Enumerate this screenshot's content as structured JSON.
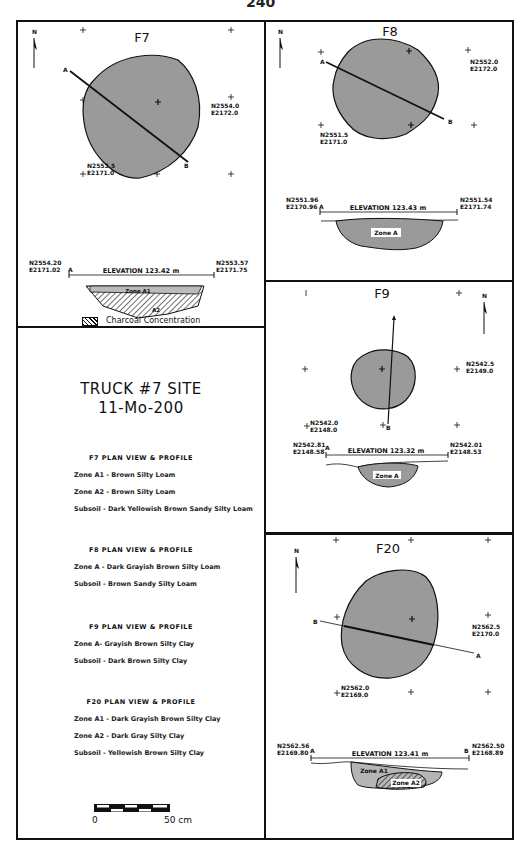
{
  "page_number": "240",
  "panels": {
    "f7": {
      "title": "F7",
      "north": "N",
      "datum1": {
        "n": "N2554.0",
        "e": "E2172.0"
      },
      "datum2": {
        "n": "N2553.5",
        "e": "E2171.0"
      },
      "section_a": "A",
      "section_b": "B",
      "profile": {
        "left": {
          "n": "N2554.20",
          "e": "E2171.02"
        },
        "right": {
          "n": "N2553.57",
          "e": "E2171.75"
        },
        "elevation": "ELEVATION  123.42  m",
        "zone_a1": "Zone A1",
        "zone_a2": "A2"
      },
      "legend": "Charcoal Concentration"
    },
    "f8": {
      "title": "F8",
      "north": "N",
      "datum1": {
        "n": "N2552.0",
        "e": "E2172.0"
      },
      "datum2": {
        "n": "N2551.5",
        "e": "E2171.0"
      },
      "section_a": "A",
      "section_b": "B",
      "profile": {
        "left": {
          "n": "N2551.96",
          "e": "E2170.96"
        },
        "right": {
          "n": "N2551.54",
          "e": "E2171.74"
        },
        "elevation": "ELEVATION  123.43  m",
        "zone": "Zone A"
      }
    },
    "f9": {
      "title": "F9",
      "north": "N",
      "datum1": {
        "n": "N2542.5",
        "e": "E2149.0"
      },
      "datum2": {
        "n": "N2542.0",
        "e": "E2148.0"
      },
      "section_a": "A",
      "section_b": "B",
      "profile": {
        "left": {
          "n": "N2542.81",
          "e": "E2148.58"
        },
        "right": {
          "n": "N2542.01",
          "e": "E2148.53"
        },
        "elevation": "ELEVATION  123.32  m",
        "zone": "Zone A"
      }
    },
    "f20": {
      "title": "F20",
      "north": "N",
      "datum1": {
        "n": "N2562.5",
        "e": "E2170.0"
      },
      "datum2": {
        "n": "N2562.0",
        "e": "E2169.0"
      },
      "section_a": "A",
      "section_b": "B",
      "profile": {
        "left": {
          "n": "N2562.56",
          "e": "E2169.80"
        },
        "right": {
          "n": "N2562.50",
          "e": "E2168.89"
        },
        "elevation": "ELEVATION  123.41  m",
        "zone_a1": "Zone A1",
        "zone_a2": "Zone A2"
      }
    }
  },
  "key": {
    "site_title": "TRUCK  #7 SITE",
    "site_number": "11-Mo-200",
    "sections": [
      {
        "heading": "F7   PLAN VIEW & PROFILE",
        "rows": [
          "Zone A1 - Brown Silty Loam",
          "Zone A2 - Brown Silty Loam",
          "Subsoil - Dark Yellowish Brown Sandy Silty Loam"
        ]
      },
      {
        "heading": "F8   PLAN VIEW & PROFILE",
        "rows": [
          "Zone A - Dark Grayish Brown Silty Loam",
          "Subsoil - Brown Sandy Silty Loam"
        ]
      },
      {
        "heading": "F9  PLAN VIEW & PROFILE",
        "rows": [
          "Zone A- Grayish Brown Silty Clay",
          "Subsoil - Dark Brown Silty Clay"
        ]
      },
      {
        "heading": "F20 PLAN VIEW & PROFILE",
        "rows": [
          "Zone A1 - Dark Grayish Brown Silty Clay",
          "Zone A2 - Dark Gray Silty Clay",
          "Subsoil - Yellowish Brown Silty Clay"
        ]
      }
    ],
    "scale": {
      "start": "0",
      "end": "50 cm"
    }
  },
  "colors": {
    "feature_fill": "#9a9a9a",
    "line": "#111111"
  }
}
